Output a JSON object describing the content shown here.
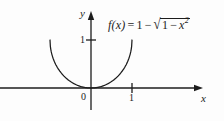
{
  "figure": {
    "background_color": "#fdfdfd",
    "stroke_color": "#1c1c1c",
    "width": 224,
    "height": 121,
    "formula": {
      "function_name": "f",
      "argument": "x",
      "prefix": "f(x)",
      "equals": "=",
      "leading_term": "1",
      "minus": "−",
      "radical_sign": "√",
      "radicand_first": "1",
      "radicand_minus": "−",
      "radicand_variable": "x",
      "radicand_exponent": "2",
      "plain_text": "f(x) = 1 − √(1 − x²)"
    },
    "axes": {
      "x_axis_label": "x",
      "y_axis_label": "y",
      "origin_label": "0",
      "x_tick_label": "1",
      "y_tick_label": "1"
    }
  },
  "chart_data": {
    "type": "line",
    "title": "",
    "subtitle": "",
    "xlabel": "x",
    "ylabel": "y",
    "annotations": [
      {
        "text": "f(x) = 1 − √(1 − x²)",
        "x": 0.45,
        "y": 1.45,
        "role": "curve-equation"
      }
    ],
    "legend": [],
    "legend_position": "none",
    "grid": false,
    "xlim": [
      -1.35,
      2.65
    ],
    "ylim": [
      -0.45,
      1.6
    ],
    "xticks": [
      0,
      1
    ],
    "xtick_labels": [
      "0",
      "1"
    ],
    "yticks": [
      1
    ],
    "ytick_labels": [
      "1"
    ],
    "origin_marked": true,
    "series": [
      {
        "name": "f(x) = 1 - sqrt(1 - x^2)",
        "equation": "1 - sqrt(1 - x^2)",
        "domain": [
          -1.0,
          1.0
        ],
        "color": "#1c1c1c",
        "x": [
          -1.0,
          -0.95,
          -0.9,
          -0.8,
          -0.7,
          -0.6,
          -0.5,
          -0.4,
          -0.3,
          -0.2,
          -0.1,
          0.0,
          0.1,
          0.2,
          0.3,
          0.4,
          0.5,
          0.6,
          0.7,
          0.8,
          0.9,
          0.95,
          1.0
        ],
        "y": [
          1.0,
          0.688,
          0.564,
          0.4,
          0.286,
          0.2,
          0.134,
          0.083,
          0.046,
          0.02,
          0.005,
          0.0,
          0.005,
          0.02,
          0.046,
          0.083,
          0.134,
          0.2,
          0.286,
          0.4,
          0.564,
          0.688,
          1.0
        ],
        "key_points": [
          {
            "label": "minimum at origin",
            "x": 0,
            "y": 0
          },
          {
            "label": "left endpoint",
            "x": -1,
            "y": 1
          },
          {
            "label": "right endpoint",
            "x": 1,
            "y": 1
          }
        ]
      }
    ]
  }
}
